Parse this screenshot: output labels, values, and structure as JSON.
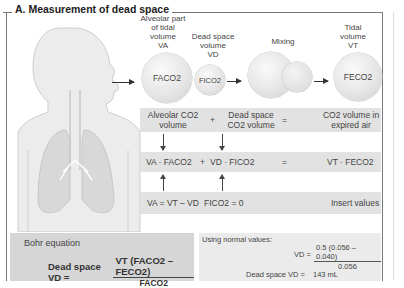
{
  "title": "A. Measurement of dead space",
  "top": {
    "alveolar_label": [
      "Alveolar part",
      "of tidal",
      "volume",
      "VA"
    ],
    "deadspace_label": [
      "Dead space",
      "volume",
      "VD"
    ],
    "mixing_label": "Mixing",
    "tidal_label": [
      "Tidal",
      "volume",
      "VT"
    ],
    "sphere_alveolar": "FACO2",
    "sphere_deadspace": "FICO2",
    "sphere_tidal": "FECO2"
  },
  "rows": {
    "row1": {
      "a": "Alveolar CO2 volume",
      "plus": "+",
      "b": "Dead space CO2 volume",
      "eq": "=",
      "c": "CO2 volume in expired air"
    },
    "row2": {
      "a": "VA · FACO2",
      "plus": "+",
      "b": "VD · FICO2",
      "eq": "=",
      "c": "VT · FECO2"
    },
    "row3": {
      "a": "VA = VT – VD",
      "b": "FICO2 = 0",
      "c": "Insert values"
    }
  },
  "bohr": {
    "heading": "Bohr equation",
    "lhs": "Dead space VD =",
    "numerator": "VT (FACO2 – FECO2)",
    "denominator": "FACO2"
  },
  "normal": {
    "heading": "Using normal values:",
    "vd_label": "VD =",
    "numerator": "0.5 (0.056 – 0.040)",
    "denominator": "0.056",
    "result_label": "Dead space VD =",
    "result_value": "143 mL"
  }
}
